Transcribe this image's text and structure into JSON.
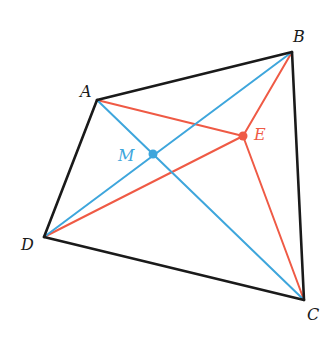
{
  "diagram": {
    "type": "quadrilateral",
    "colors": {
      "outline": "#1a1a1a",
      "blue": "#3ea6dc",
      "red": "#ef5a45"
    },
    "points": {
      "A": {
        "x": 97,
        "y": 100,
        "label": "A",
        "lx": 80,
        "ly": 97
      },
      "B": {
        "x": 292,
        "y": 52,
        "label": "B",
        "lx": 293,
        "ly": 42
      },
      "C": {
        "x": 304,
        "y": 300,
        "label": "C",
        "lx": 307,
        "ly": 320
      },
      "D": {
        "x": 44,
        "y": 237,
        "label": "D",
        "lx": 21,
        "ly": 250
      },
      "M": {
        "x": 153,
        "y": 154,
        "label": "M",
        "lx": 118,
        "ly": 161
      },
      "E": {
        "x": 243,
        "y": 136,
        "label": "E",
        "lx": 254,
        "ly": 140
      }
    },
    "sides": [
      [
        "A",
        "B"
      ],
      [
        "B",
        "C"
      ],
      [
        "C",
        "D"
      ],
      [
        "D",
        "A"
      ]
    ],
    "blue_segments": [
      [
        "A",
        "C"
      ],
      [
        "B",
        "D"
      ]
    ],
    "red_segments": [
      [
        "A",
        "E"
      ],
      [
        "B",
        "E"
      ],
      [
        "C",
        "E"
      ],
      [
        "D",
        "E"
      ]
    ]
  }
}
